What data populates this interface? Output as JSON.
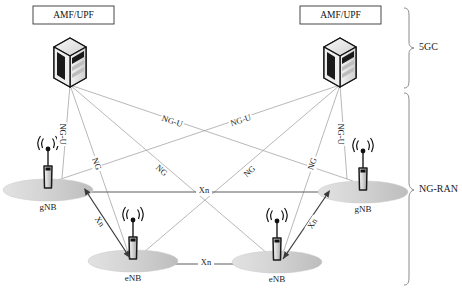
{
  "figure": {
    "type": "network-architecture-diagram",
    "background_color": "#ffffff"
  },
  "core_nodes": [
    {
      "id": "amf-upf-left",
      "label": "AMF/UPF",
      "icon": "server-rack-icon",
      "box": {
        "x": 33,
        "y": 6,
        "w": 81,
        "h": 18
      },
      "icon_center": {
        "x": 70,
        "y": 58
      },
      "fan_origin": {
        "x": 70,
        "y": 85
      }
    },
    {
      "id": "amf-upf-right",
      "label": "AMF/UPF",
      "icon": "server-rack-icon",
      "box": {
        "x": 300,
        "y": 6,
        "w": 81,
        "h": 18
      },
      "icon_center": {
        "x": 340,
        "y": 58
      },
      "fan_origin": {
        "x": 340,
        "y": 85
      }
    }
  ],
  "ran_nodes": [
    {
      "id": "gnb-left",
      "label": "gNB",
      "type": "gNB",
      "icon": "base-station-antenna-icon",
      "tower": {
        "x": 48,
        "y": 190
      },
      "ellipse": {
        "cx": 48,
        "cy": 190,
        "rx": 45,
        "ry": 11
      },
      "label_pos": {
        "x": 48,
        "y": 208
      },
      "connect": {
        "x": 86,
        "y": 193
      }
    },
    {
      "id": "gnb-right",
      "label": "gNB",
      "type": "gNB",
      "icon": "base-station-antenna-icon",
      "tower": {
        "x": 363,
        "y": 192
      },
      "ellipse": {
        "cx": 363,
        "cy": 192,
        "rx": 45,
        "ry": 11
      },
      "label_pos": {
        "x": 363,
        "y": 210
      },
      "connect": {
        "x": 327,
        "y": 194
      }
    },
    {
      "id": "enb-left",
      "label": "eNB",
      "type": "eNB",
      "icon": "base-station-antenna-icon",
      "tower": {
        "x": 133,
        "y": 261
      },
      "ellipse": {
        "cx": 133,
        "cy": 261,
        "rx": 45,
        "ry": 11
      },
      "label_pos": {
        "x": 133,
        "y": 279
      },
      "connect": {
        "x": 171,
        "y": 263
      }
    },
    {
      "id": "enb-right",
      "label": "eNB",
      "type": "eNB",
      "icon": "base-station-antenna-icon",
      "tower": {
        "x": 277,
        "y": 262
      },
      "ellipse": {
        "cx": 277,
        "cy": 262,
        "rx": 45,
        "ry": 11
      },
      "label_pos": {
        "x": 277,
        "y": 280
      },
      "connect": {
        "x": 240,
        "y": 264
      }
    }
  ],
  "links": {
    "ng_color": "#8c8c8c",
    "xn_color": "#3a3a3a",
    "control_color": "#9a9a9a",
    "items": [
      {
        "id": "ngu-left-vertical",
        "label": "NG-U",
        "from": "amf-upf-left",
        "to": "gnb-left",
        "x1": 70,
        "y1": 85,
        "x2": 62,
        "y2": 175,
        "label_x": 62,
        "label_y": 134,
        "rotate": 90
      },
      {
        "id": "ng-left-to-enb-left",
        "label": "NG",
        "from": "amf-upf-left",
        "to": "enb-left",
        "x1": 70,
        "y1": 85,
        "x2": 128,
        "y2": 250,
        "label_x": 96,
        "label_y": 164,
        "rotate": 70
      },
      {
        "id": "ng-left-to-enb-right",
        "label": "NG",
        "from": "amf-upf-left",
        "to": "enb-right",
        "x1": 70,
        "y1": 85,
        "x2": 266,
        "y2": 252,
        "label_x": 161,
        "label_y": 171,
        "rotate": 42
      },
      {
        "id": "ngu-left-to-gnb-right",
        "label": "NG-U",
        "from": "amf-upf-left",
        "to": "gnb-right",
        "x1": 70,
        "y1": 85,
        "x2": 352,
        "y2": 178,
        "label_x": 172,
        "label_y": 122,
        "rotate": 18
      },
      {
        "id": "ngu-right-vertical",
        "label": "NG-U",
        "from": "amf-upf-right",
        "to": "gnb-right",
        "x1": 340,
        "y1": 85,
        "x2": 346,
        "y2": 176,
        "label_x": 340,
        "label_y": 134,
        "rotate": 90
      },
      {
        "id": "ng-right-to-enb-right",
        "label": "NG",
        "from": "amf-upf-right",
        "to": "enb-right",
        "x1": 340,
        "y1": 85,
        "x2": 284,
        "y2": 251,
        "label_x": 313,
        "label_y": 164,
        "rotate": -70
      },
      {
        "id": "ng-right-to-enb-left",
        "label": "NG",
        "from": "amf-upf-right",
        "to": "enb-left",
        "x1": 340,
        "y1": 85,
        "x2": 146,
        "y2": 250,
        "label_x": 250,
        "label_y": 172,
        "rotate": -42
      },
      {
        "id": "ngu-right-to-gnb-left",
        "label": "NG-U",
        "from": "amf-upf-right",
        "to": "gnb-left",
        "x1": 340,
        "y1": 85,
        "x2": 60,
        "y2": 177,
        "label_x": 241,
        "label_y": 121,
        "rotate": -18
      },
      {
        "id": "xn-gnb-gnb",
        "label": "Xn",
        "from": "gnb-left",
        "to": "gnb-right",
        "x1": 86,
        "y1": 192,
        "x2": 327,
        "y2": 192,
        "label_x": 204,
        "label_y": 191,
        "rotate": 0
      },
      {
        "id": "xn-enb-enb",
        "label": "Xn",
        "from": "enb-left",
        "to": "enb-right",
        "x1": 171,
        "y1": 264,
        "x2": 240,
        "y2": 264,
        "label_x": 206,
        "label_y": 263,
        "rotate": 0
      },
      {
        "id": "xn-gnb-left-enb-left",
        "label": "Xn",
        "from": "gnb-left",
        "to": "enb-left",
        "x1": 86,
        "y1": 194,
        "x2": 128,
        "y2": 259,
        "label_x": 99,
        "label_y": 222,
        "rotate": 57
      },
      {
        "id": "xn-gnb-right-enb-right",
        "label": "Xn",
        "from": "gnb-right",
        "to": "enb-right",
        "x1": 327,
        "y1": 196,
        "x2": 284,
        "y2": 261,
        "label_x": 313,
        "label_y": 224,
        "rotate": -57
      }
    ]
  },
  "braces": [
    {
      "id": "brace-5gc",
      "label": "5GC",
      "y_top": 8,
      "y_bottom": 88,
      "label_x": 424,
      "label_y": 48
    },
    {
      "id": "brace-ng-ran",
      "label": "NG-RAN",
      "y_top": 93,
      "y_bottom": 285,
      "label_x": 424,
      "label_y": 190
    }
  ]
}
